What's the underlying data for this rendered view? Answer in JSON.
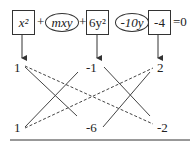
{
  "equation": {
    "terms": [
      {
        "id": "x2",
        "text": "x²",
        "shape": "box"
      },
      {
        "id": "mxy",
        "text": "mxy",
        "shape": "ellipse"
      },
      {
        "id": "6y2",
        "text": "6y²",
        "shape": "box"
      },
      {
        "id": "neg10y",
        "text": "-10y",
        "shape": "ellipse"
      },
      {
        "id": "neg4",
        "text": "-4",
        "shape": "box"
      }
    ],
    "operators": [
      "+",
      "+"
    ],
    "rhs": "=0"
  },
  "cross_method": {
    "top_row": [
      "1",
      "-1",
      "2"
    ],
    "bottom_row": [
      "1",
      "-6",
      "-2"
    ]
  }
}
